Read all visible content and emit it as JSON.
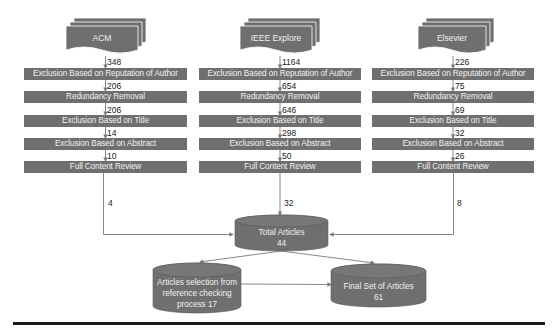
{
  "colors": {
    "box_fill": "#6f6f6f",
    "box_text": "#f2f2f2",
    "line": "#7a7a7a",
    "rule": "#1a1a1a"
  },
  "sources": [
    {
      "name": "ACM",
      "initial_count": "348",
      "steps": [
        {
          "label": "Exclusion Based on Reputation of Author",
          "count_after": "206"
        },
        {
          "label": "Redundancy Removal",
          "count_after": "206"
        },
        {
          "label": "Exclusion Based on Title",
          "count_after": "14"
        },
        {
          "label": "Exclusion Based on Abstract",
          "count_after": "10"
        },
        {
          "label": "Full Content Review",
          "count_after": "4"
        }
      ]
    },
    {
      "name": "IEEE Explore",
      "initial_count": "1164",
      "steps": [
        {
          "label": "Exclusion Based on Reputation of Author",
          "count_after": "654"
        },
        {
          "label": "Redundancy Removal",
          "count_after": "646"
        },
        {
          "label": "Exclusion Based on Title",
          "count_after": "298"
        },
        {
          "label": "Exclusion Based on Abstract",
          "count_after": "50"
        },
        {
          "label": "Full Content Review",
          "count_after": "32"
        }
      ]
    },
    {
      "name": "Elsevier",
      "initial_count": "226",
      "steps": [
        {
          "label": "Exclusion Based on Reputation of Author",
          "count_after": "75"
        },
        {
          "label": "Redundancy Removal",
          "count_after": "69"
        },
        {
          "label": "Exclusion Based on Title",
          "count_after": "32"
        },
        {
          "label": "Exclusion Based on Abstract",
          "count_after": "26"
        },
        {
          "label": "Full Content Review",
          "count_after": "8"
        }
      ]
    }
  ],
  "total": {
    "line1": "Total Articles",
    "line2": "44"
  },
  "reference_check": {
    "line1": "Articles selection from",
    "line2": "reference checking",
    "line3": "process 17"
  },
  "final": {
    "line1": "Final Set of Articles",
    "line2": "61"
  }
}
